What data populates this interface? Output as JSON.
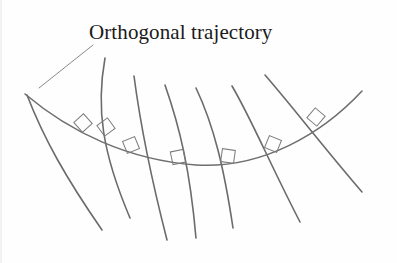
{
  "figure": {
    "title_label": "Orthogonal trajectory",
    "background_color": "#fefefe",
    "curve_color": "#6b6b6b",
    "trajectory_color": "#6e6e6e",
    "marker_color": "#7a7a7a",
    "leader_color": "#8a8a8a",
    "text_color": "#1a1a1a",
    "stroke_width": 1.6,
    "marker_stroke_width": 1.0,
    "leader_stroke_width": 1.0
  },
  "chart_data": {
    "type": "line",
    "title": "Orthogonal trajectory",
    "xlabel": "",
    "ylabel": "",
    "xlim": [
      0,
      397
    ],
    "ylim": [
      0,
      263
    ],
    "grid": false,
    "legend": "none",
    "annotations": [
      {
        "name": "orthogonal-trajectory-label",
        "text": "Orthogonal trajectory",
        "x": 89,
        "y": 38,
        "leader_from": [
          93,
          45
        ],
        "leader_to": [
          39,
          88
        ]
      }
    ],
    "series": [
      {
        "name": "orthogonal-trajectory",
        "role": "trajectory",
        "path": "M 25,94 C 70,132 128,160 196,165 C 262,169 322,134 362,91"
      },
      {
        "name": "family-curve-1",
        "role": "family",
        "path": "M 27,95 C 44,139 66,178 102,230"
      },
      {
        "name": "family-curve-2",
        "role": "family",
        "path": "M 105,58 C 96,108 102,152 130,218"
      },
      {
        "name": "family-curve-3",
        "role": "family",
        "path": "M 134,76 C 140,122 148,166 167,240"
      },
      {
        "name": "family-curve-4",
        "role": "family",
        "path": "M 165,85 C 180,128 190,170 196,238"
      },
      {
        "name": "family-curve-5",
        "role": "family",
        "path": "M 196,88 C 214,126 224,168 233,228"
      },
      {
        "name": "family-curve-6",
        "role": "family",
        "path": "M 232,86 C 252,120 268,160 300,222"
      },
      {
        "name": "family-curve-7",
        "role": "family",
        "path": "M 265,75 C 292,106 320,143 362,192"
      }
    ],
    "right_angle_markers": [
      {
        "name": "right-angle-marker-1",
        "x": 83,
        "y": 123,
        "rotation": -42
      },
      {
        "name": "right-angle-marker-2",
        "x": 131,
        "y": 145,
        "rotation": -22
      },
      {
        "name": "right-angle-marker-3",
        "x": 178,
        "y": 157,
        "rotation": -12
      },
      {
        "name": "right-angle-marker-4",
        "x": 228,
        "y": 156,
        "rotation": 8
      },
      {
        "name": "right-angle-marker-5",
        "x": 273,
        "y": 144,
        "rotation": 22
      },
      {
        "name": "right-angle-marker-6",
        "x": 316,
        "y": 117,
        "rotation": 40
      },
      {
        "name": "right-angle-marker-7",
        "x": 106,
        "y": 127,
        "rotation": -36
      }
    ]
  }
}
